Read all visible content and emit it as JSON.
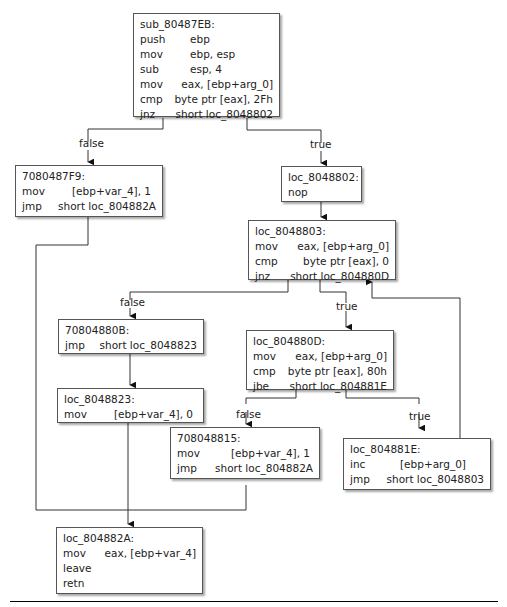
{
  "blocks": {
    "sub": {
      "label": "sub_80487EB:",
      "rows": [
        {
          "op": "push",
          "args": "ebp"
        },
        {
          "op": "mov",
          "args": "ebp, esp"
        },
        {
          "op": "sub",
          "args": "esp, 4"
        },
        {
          "op": "mov",
          "args": "eax, [ebp+arg_0]"
        },
        {
          "op": "cmp",
          "args": "byte ptr [eax], 2Fh"
        },
        {
          "op": "jnz",
          "args": "short loc_8048802"
        }
      ]
    },
    "b7F9": {
      "label": "7080487F9:",
      "rows": [
        {
          "op": "mov",
          "args": "[ebp+var_4], 1"
        },
        {
          "op": "jmp",
          "args": "short loc_804882A"
        }
      ]
    },
    "b802": {
      "label": "loc_8048802:",
      "rows": [
        {
          "op": "nop",
          "args": ""
        }
      ]
    },
    "b803": {
      "label": "loc_8048803:",
      "rows": [
        {
          "op": "mov",
          "args": "eax, [ebp+arg_0]"
        },
        {
          "op": "cmp",
          "args": "byte ptr [eax], 0"
        },
        {
          "op": "jnz",
          "args": "short loc_804880D"
        }
      ]
    },
    "b80B": {
      "label": "70804880B:",
      "rows": [
        {
          "op": "jmp",
          "args": "short loc_8048823"
        }
      ]
    },
    "b80D": {
      "label": "loc_804880D:",
      "rows": [
        {
          "op": "mov",
          "args": "eax, [ebp+arg_0]"
        },
        {
          "op": "cmp",
          "args": "byte ptr [eax], 80h"
        },
        {
          "op": "jbe",
          "args": "short loc_804881E"
        }
      ]
    },
    "b823": {
      "label": "loc_8048823:",
      "rows": [
        {
          "op": "mov",
          "args": "[ebp+var_4], 0"
        }
      ]
    },
    "b815": {
      "label": "708048815:",
      "rows": [
        {
          "op": "mov",
          "args": "[ebp+var_4], 1"
        },
        {
          "op": "jmp",
          "args": "short loc_804882A"
        }
      ]
    },
    "b81E": {
      "label": "loc_804881E:",
      "rows": [
        {
          "op": "inc",
          "args": "[ebp+arg_0]"
        },
        {
          "op": "jmp",
          "args": "short loc_8048803"
        }
      ]
    },
    "b82A": {
      "label": "loc_804882A:",
      "rows": [
        {
          "op": "mov",
          "args": "eax, [ebp+var_4]"
        },
        {
          "op": "leave",
          "args": ""
        },
        {
          "op": "retn",
          "args": ""
        }
      ]
    }
  },
  "edge_labels": {
    "sub_false": "false",
    "sub_true": "true",
    "b803_false": "false",
    "b803_true": "true",
    "b80D_false": "false",
    "b80D_true": "true"
  }
}
